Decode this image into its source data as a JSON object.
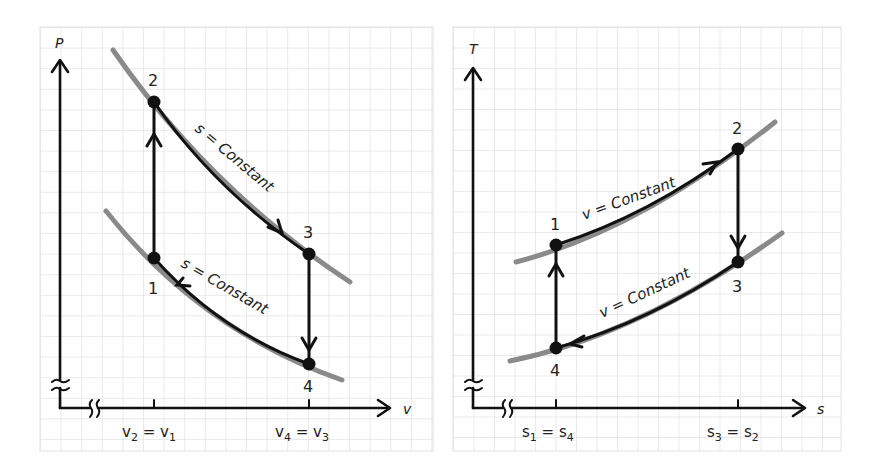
{
  "left_panel": {
    "y_axis_label": "P",
    "x_axis_label": "v",
    "points": [
      {
        "label": "1",
        "x": 154,
        "y": 258
      },
      {
        "label": "2",
        "x": 154,
        "y": 102
      },
      {
        "label": "3",
        "x": 309,
        "y": 254
      },
      {
        "label": "4",
        "x": 309,
        "y": 364
      }
    ],
    "annotations": [
      "s = Constant",
      "s = Constant"
    ],
    "x_ticks": [
      {
        "main": "v",
        "sub": "2",
        "eq": " = ",
        "main2": "v",
        "sub2": "1"
      },
      {
        "main": "v",
        "sub": "4",
        "eq": " = ",
        "main2": "v",
        "sub2": "3"
      }
    ],
    "x_tick_labels": [
      "v2 = v1",
      "v4 = v3"
    ]
  },
  "right_panel": {
    "y_axis_label": "T",
    "x_axis_label": "s",
    "points": [
      {
        "label": "1",
        "x": 556,
        "y": 245
      },
      {
        "label": "2",
        "x": 738,
        "y": 149
      },
      {
        "label": "3",
        "x": 738,
        "y": 262
      },
      {
        "label": "4",
        "x": 556,
        "y": 348
      }
    ],
    "annotations": [
      "v = Constant",
      "v = Constant"
    ],
    "x_ticks": [
      {
        "main": "s",
        "sub": "1",
        "eq": " = ",
        "main2": "s",
        "sub2": "4"
      },
      {
        "main": "s",
        "sub": "3",
        "eq": " = ",
        "main2": "s",
        "sub2": "2"
      }
    ],
    "x_tick_labels": [
      "s1 = s4",
      "s3 = s2"
    ]
  },
  "colors": {
    "grid": "#d6d6d6",
    "process_line": "#111111",
    "isoline": "#8a8a8a"
  }
}
